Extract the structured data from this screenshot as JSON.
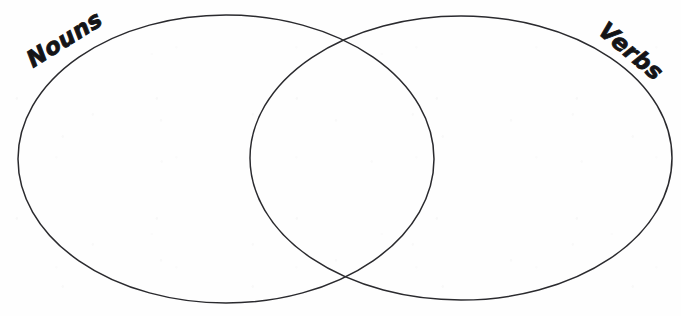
{
  "page": {
    "type": "venn-diagram",
    "width": 681,
    "height": 316,
    "background_color": "#fefefe",
    "stroke_color": "#2a2a2e",
    "stroke_width": 1.5,
    "text_color": "#141417"
  },
  "diagram": {
    "title": "",
    "sets": [
      {
        "id": "left",
        "label": "Nouns",
        "label_rotation_deg": -32,
        "label_x": 33,
        "label_y": 68,
        "center_x": 226,
        "center_y": 159,
        "radius_x": 208,
        "radius_y": 144,
        "items": []
      },
      {
        "id": "right",
        "label": "Verbs",
        "label_rotation_deg": 40,
        "label_x": 597,
        "label_y": 33,
        "center_x": 461,
        "center_y": 158,
        "radius_x": 211,
        "radius_y": 142,
        "items": []
      }
    ],
    "intersection": {
      "label": "",
      "items": [],
      "top_point_x": 342,
      "top_point_y": 42,
      "bottom_point_x": 343,
      "bottom_point_y": 282
    }
  }
}
